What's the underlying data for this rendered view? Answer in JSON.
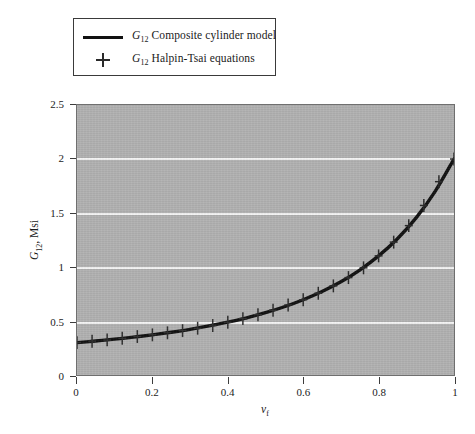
{
  "chart_data": {
    "type": "line",
    "title": "",
    "xlabel": "v_f",
    "xlabel_sym": "v",
    "xlabel_sub": "f",
    "ylabel": "G12, Msi",
    "ylabel_sym": "G",
    "ylabel_sub": "12",
    "ylabel_unit": ", Msi",
    "xlim": [
      0,
      1
    ],
    "ylim": [
      0,
      2.5
    ],
    "grid": "horizontal",
    "grid_color": "#f4f4f4",
    "plot_bgcolor": "#b1b1b1",
    "line_color": "#101010",
    "marker_color": "#2a2a2a",
    "xticks": [
      "0",
      "0.2",
      "0.4",
      "0.6",
      "0.8",
      "1"
    ],
    "xtick_values": [
      0,
      0.2,
      0.4,
      0.6,
      0.8,
      1
    ],
    "yticks": [
      "0",
      "0.5",
      "1",
      "1.5",
      "2",
      "2.5"
    ],
    "ytick_values": [
      0,
      0.5,
      1,
      1.5,
      2,
      2.5
    ],
    "legend_position": "above-plot-left",
    "series": [
      {
        "name": "G12 Composite cylinder model",
        "marker": "line",
        "x": [
          0.0,
          0.05,
          0.1,
          0.15,
          0.2,
          0.25,
          0.3,
          0.35,
          0.4,
          0.45,
          0.5,
          0.55,
          0.6,
          0.65,
          0.7,
          0.75,
          0.8,
          0.85,
          0.9,
          0.95,
          1.0
        ],
        "values": [
          0.3,
          0.315,
          0.332,
          0.351,
          0.372,
          0.396,
          0.423,
          0.454,
          0.489,
          0.53,
          0.577,
          0.632,
          0.697,
          0.773,
          0.863,
          0.972,
          1.103,
          1.262,
          1.457,
          1.7,
          2.0
        ]
      },
      {
        "name": "G12 Halpin-Tsai equations",
        "marker": "plus",
        "x": [
          0.0,
          0.04,
          0.08,
          0.12,
          0.16,
          0.2,
          0.24,
          0.28,
          0.32,
          0.36,
          0.4,
          0.44,
          0.48,
          0.52,
          0.56,
          0.6,
          0.64,
          0.68,
          0.72,
          0.76,
          0.8,
          0.84,
          0.88,
          0.92,
          0.96,
          1.0
        ],
        "values": [
          0.3,
          0.312,
          0.325,
          0.34,
          0.356,
          0.372,
          0.391,
          0.411,
          0.433,
          0.458,
          0.489,
          0.522,
          0.558,
          0.6,
          0.648,
          0.697,
          0.757,
          0.825,
          0.902,
          0.992,
          1.103,
          1.23,
          1.383,
          1.57,
          1.79,
          2.0
        ]
      }
    ]
  },
  "legend": {
    "items": [
      {
        "key": "line",
        "sym": "G",
        "sub": "12",
        "label": "Composite cylinder model"
      },
      {
        "key": "plus",
        "sym": "G",
        "sub": "12",
        "label": "Halpin-Tsai equations"
      }
    ]
  }
}
